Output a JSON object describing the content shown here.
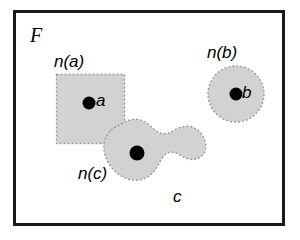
{
  "figure": {
    "type": "set-theory-neighborhood-diagram",
    "frame": {
      "label": "F",
      "border_color": "#1a1a1a",
      "background_color": "#ffffff"
    },
    "fill_color": "#d2d2d2",
    "outline_color": "#9a9a9a",
    "point_color": "#000000",
    "regions": [
      {
        "id": "n-a",
        "label": "n(a)",
        "shape": "square",
        "point_label": "a"
      },
      {
        "id": "n-b",
        "label": "n(b)",
        "shape": "circle",
        "point_label": "b"
      },
      {
        "id": "n-c",
        "label": "n(c)",
        "shape": "blob",
        "point_label": "c"
      }
    ],
    "labels": {
      "frame": "F",
      "neighborhood_a": "n(a)",
      "neighborhood_b": "n(b)",
      "neighborhood_c": "n(c)",
      "point_a": "a",
      "point_b": "b",
      "point_c": "c",
      "outer_c": "c"
    }
  }
}
